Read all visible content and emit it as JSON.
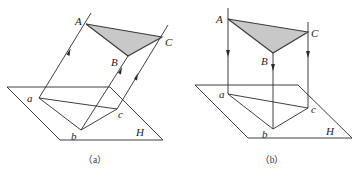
{
  "figure": {
    "panels": [
      {
        "id": "a",
        "caption": "（a）",
        "projection_type": "oblique",
        "plane_label": "H",
        "space_points": {
          "A": "A",
          "B": "B",
          "C": "C"
        },
        "projected_points": {
          "a": "a",
          "b": "b",
          "c": "c"
        },
        "triangle_fill": "#c8c8c8"
      },
      {
        "id": "b",
        "caption": "（b）",
        "projection_type": "orthogonal",
        "plane_label": "H",
        "space_points": {
          "A": "A",
          "B": "B",
          "C": "C"
        },
        "projected_points": {
          "a": "a",
          "b": "b",
          "c": "c"
        },
        "triangle_fill": "#c8c8c8"
      }
    ]
  }
}
